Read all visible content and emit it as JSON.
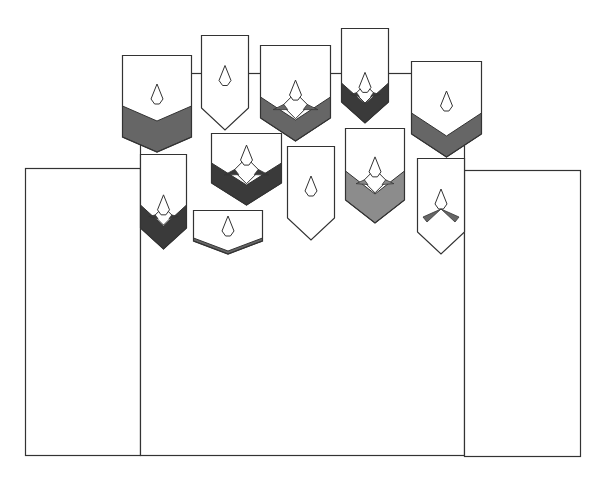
{
  "diagram": {
    "colors": {
      "background": "#ffffff",
      "stroke": "#333333",
      "dark": "#3a3a3a",
      "medium": "#666666",
      "light": "#8c8c8c"
    },
    "panels": [
      {
        "id": "left-panel",
        "x": 25,
        "y": 168,
        "w": 115,
        "h": 287
      },
      {
        "id": "center-panel",
        "x": 140,
        "y": 73,
        "w": 324,
        "h": 382
      },
      {
        "id": "right-panel",
        "x": 464,
        "y": 170,
        "w": 116,
        "h": 286
      }
    ],
    "connector_line_y": 73,
    "banners": [
      {
        "id": "banner-1",
        "x": 122,
        "y": 55,
        "w": 69,
        "side": 137,
        "tip": 152,
        "band": "medium",
        "bandTop": 106,
        "inner": "none"
      },
      {
        "id": "banner-2",
        "x": 201,
        "y": 35,
        "w": 47,
        "side": 108,
        "tip": 130,
        "band": "none",
        "inner": "none"
      },
      {
        "id": "banner-3",
        "x": 260,
        "y": 45,
        "w": 70,
        "side": 118,
        "tip": 141,
        "band": "medium",
        "bandTop": 97,
        "inner": "diamond"
      },
      {
        "id": "banner-4",
        "x": 341,
        "y": 28,
        "w": 47,
        "side": 102,
        "tip": 123,
        "band": "dark",
        "bandTop": 83,
        "inner": "diamond"
      },
      {
        "id": "banner-5",
        "x": 411,
        "y": 61,
        "w": 70,
        "side": 134,
        "tip": 157,
        "band": "medium",
        "bandTop": 113,
        "inner": "none"
      },
      {
        "id": "banner-6",
        "x": 140,
        "y": 154,
        "w": 46,
        "side": 228,
        "tip": 249,
        "band": "dark",
        "bandTop": 205,
        "inner": "diamond"
      },
      {
        "id": "banner-7",
        "x": 211,
        "y": 133,
        "w": 70,
        "side": 183,
        "tip": 205,
        "band": "dark",
        "bandTop": 163,
        "inner": "diamond"
      },
      {
        "id": "banner-8",
        "x": 193,
        "y": 210,
        "w": 69,
        "side": 241,
        "tip": 254,
        "band": "medium",
        "bandTop": 238,
        "inner": "none"
      },
      {
        "id": "banner-9",
        "x": 287,
        "y": 146,
        "w": 47,
        "side": 218,
        "tip": 240,
        "band": "none",
        "inner": "none"
      },
      {
        "id": "banner-10",
        "x": 345,
        "y": 128,
        "w": 59,
        "side": 200,
        "tip": 223,
        "band": "light",
        "bandTop": 171,
        "inner": "diamond"
      },
      {
        "id": "banner-11",
        "x": 417,
        "y": 158,
        "w": 47,
        "side": 232,
        "tip": 254,
        "band": "none",
        "inner": "propeller"
      }
    ]
  }
}
